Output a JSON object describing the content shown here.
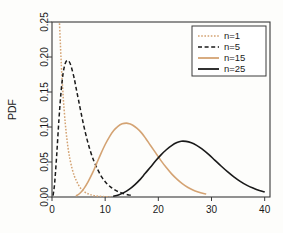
{
  "chart_data": {
    "type": "line",
    "title": "",
    "subtitle": "",
    "xlabel": "",
    "ylabel": "PDF",
    "xlim": [
      0,
      41
    ],
    "ylim": [
      0,
      0.25
    ],
    "xticks": [
      "0",
      "10",
      "20",
      "30",
      "40"
    ],
    "xtick_values": [
      0,
      10,
      20,
      30,
      40
    ],
    "yticks": [
      "0.00",
      "0.05",
      "0.10",
      "0.15",
      "0.20",
      "0.25"
    ],
    "ytick_values": [
      0.0,
      0.05,
      0.1,
      0.15,
      0.2,
      0.25
    ],
    "grid": false,
    "legend_position": "top-right",
    "series": [
      {
        "name": "n=1",
        "label": "n=1",
        "color": "#d4a373",
        "dash": "dotted",
        "dasharray": "1.6 1.6",
        "width": 1.5,
        "x": [
          1.4,
          1.4,
          1.5,
          1.6,
          1.7,
          1.8,
          2.0,
          2.2,
          2.5,
          2.8,
          3.1,
          3.4,
          3.8,
          4.2,
          4.6,
          5.0,
          5.5,
          6.0,
          6.6,
          7.2,
          8.0,
          9.0,
          10.0,
          11.0
        ],
        "y": [
          0.25,
          0.25,
          0.232,
          0.215,
          0.198,
          0.182,
          0.156,
          0.133,
          0.105,
          0.083,
          0.066,
          0.053,
          0.04,
          0.03,
          0.023,
          0.017,
          0.0115,
          0.008,
          0.0052,
          0.0034,
          0.0018,
          0.0009,
          0.0005,
          0.0003
        ]
      },
      {
        "name": "n=5",
        "label": "n=5",
        "color": "#1a1a1a",
        "dash": "dashed",
        "dasharray": "4 2.6",
        "width": 1.5,
        "x": [
          0.2,
          0.5,
          0.9,
          1.3,
          1.7,
          2.1,
          2.5,
          2.9,
          3.3,
          3.7,
          4.1,
          4.3,
          4.6,
          5.0,
          5.5,
          6.0,
          6.6,
          7.2,
          7.9,
          8.6,
          9.4,
          10.2,
          11.0,
          11.9,
          12.8,
          13.7,
          14.6,
          15.0
        ],
        "y": [
          0.002,
          0.02,
          0.062,
          0.11,
          0.15,
          0.177,
          0.191,
          0.195,
          0.1925,
          0.184,
          0.172,
          0.165,
          0.153,
          0.138,
          0.119,
          0.101,
          0.082,
          0.066,
          0.051,
          0.039,
          0.028,
          0.02,
          0.0145,
          0.0097,
          0.0065,
          0.0042,
          0.0027,
          0.0021
        ]
      },
      {
        "name": "n=15",
        "label": "n=15",
        "color": "#d4a373",
        "dash": "solid",
        "dasharray": "none",
        "width": 1.6,
        "x": [
          4.5,
          5.2,
          6.0,
          6.8,
          7.6,
          8.4,
          9.2,
          10.0,
          10.8,
          11.6,
          12.4,
          13.2,
          14.0,
          14.6,
          15.2,
          16.0,
          16.8,
          17.6,
          18.5,
          19.5,
          20.5,
          21.5,
          22.5,
          23.5,
          24.5,
          25.5,
          26.5,
          27.5,
          28.5,
          29.0
        ],
        "y": [
          0.0015,
          0.005,
          0.012,
          0.022,
          0.034,
          0.048,
          0.062,
          0.075,
          0.086,
          0.095,
          0.101,
          0.1045,
          0.1055,
          0.1045,
          0.1025,
          0.098,
          0.092,
          0.084,
          0.074,
          0.063,
          0.052,
          0.042,
          0.033,
          0.0255,
          0.019,
          0.014,
          0.01,
          0.0072,
          0.005,
          0.0042
        ]
      },
      {
        "name": "n=25",
        "label": "n=25",
        "color": "#1a1a1a",
        "dash": "solid",
        "dasharray": "none",
        "width": 1.6,
        "x": [
          11.5,
          12.5,
          13.5,
          14.5,
          15.5,
          16.5,
          17.5,
          18.5,
          19.5,
          20.5,
          21.5,
          22.5,
          23.5,
          24.3,
          25.2,
          26.2,
          27.2,
          28.2,
          29.4,
          30.6,
          31.8,
          33.0,
          34.2,
          35.4,
          36.6,
          37.8,
          39.0,
          40.0
        ],
        "y": [
          0.0012,
          0.003,
          0.0062,
          0.0108,
          0.017,
          0.0245,
          0.0335,
          0.0425,
          0.0518,
          0.0602,
          0.0675,
          0.0735,
          0.0778,
          0.0797,
          0.0795,
          0.0775,
          0.0738,
          0.0688,
          0.0612,
          0.0528,
          0.0443,
          0.0362,
          0.0288,
          0.0224,
          0.017,
          0.0127,
          0.0092,
          0.0073
        ]
      }
    ]
  },
  "legend": {
    "entries": [
      {
        "label": "n=1"
      },
      {
        "label": "n=5"
      },
      {
        "label": "n=15"
      },
      {
        "label": "n=25"
      }
    ]
  },
  "axes": {
    "y_title": "PDF"
  }
}
